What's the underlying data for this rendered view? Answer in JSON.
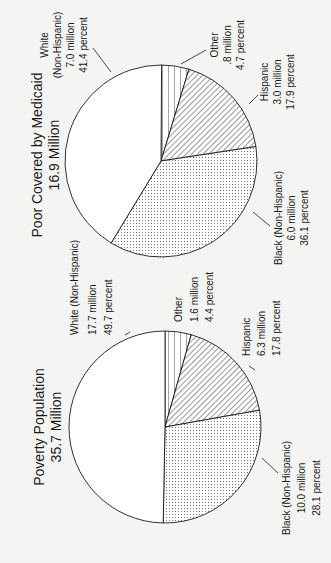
{
  "colors": {
    "background": "#f4f4f2",
    "ink": "#1a1a1a"
  },
  "chart_data": [
    {
      "type": "pie",
      "title": "Poverty Population",
      "subtitle": "35.7 Million",
      "slices": [
        {
          "name": "Other",
          "millions": 1.6,
          "percent": 4.4,
          "fill": "horizontal-lines",
          "line1": "Other",
          "line2": "1.6 million",
          "line3": "4.4 percent"
        },
        {
          "name": "Hispanic",
          "millions": 6.3,
          "percent": 17.8,
          "fill": "diagonal-hatch",
          "line1": "Hispanic",
          "line2": "6.3 million",
          "line3": "17.8 percent"
        },
        {
          "name": "Black (Non-Hispanic)",
          "millions": 10.0,
          "percent": 28.1,
          "fill": "dots",
          "line1": "Black (Non-Hispanic)",
          "line2": "10.0 million",
          "line3": "28.1 percent"
        },
        {
          "name": "White (Non-Hispanic)",
          "millions": 17.7,
          "percent": 49.7,
          "fill": "white",
          "line1": "White (Non-Hispanic)",
          "line2": "17.7 million",
          "line3": "49.7 percent"
        }
      ]
    },
    {
      "type": "pie",
      "title": "Poor Covered by Medicaid",
      "subtitle": "16.9 Million",
      "slices": [
        {
          "name": "Other",
          "millions": 0.8,
          "percent": 4.7,
          "fill": "horizontal-lines",
          "line1": "Other",
          "line2": ".8 million",
          "line3": "4.7 percent"
        },
        {
          "name": "Hispanic",
          "millions": 3.0,
          "percent": 17.9,
          "fill": "diagonal-hatch",
          "line1": "Hispanic",
          "line2": "3.0 million",
          "line3": "17.9 percent"
        },
        {
          "name": "Black (Non-Hispanic)",
          "millions": 6.0,
          "percent": 36.1,
          "fill": "dots",
          "line1": "Black (Non-Hispanic)",
          "line2": "6.0 million",
          "line3": "36.1 percent"
        },
        {
          "name": "White (Non-Hispanic)",
          "millions": 7.0,
          "percent": 41.4,
          "fill": "white",
          "line1": "White",
          "line1b": "(Non-Hispanic)",
          "line2": "7.0 million",
          "line3": "41.4 percent"
        }
      ]
    }
  ]
}
